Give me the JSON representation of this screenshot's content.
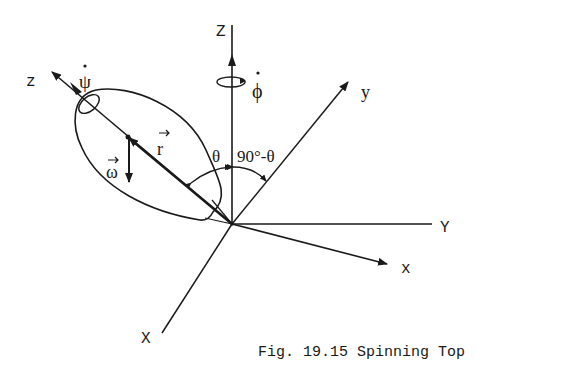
{
  "figure": {
    "caption": "Fig. 19.15 Spinning Top",
    "ink_color": "#1a1a1a",
    "background": "#ffffff"
  },
  "axes": {
    "Z": {
      "label": "Z"
    },
    "Y": {
      "label": "Y"
    },
    "X": {
      "label": "X"
    },
    "z": {
      "label": "z"
    },
    "y": {
      "label": "y"
    },
    "x": {
      "label": "x"
    }
  },
  "vectors": {
    "r": {
      "label": "r"
    },
    "omega": {
      "label": "ω"
    }
  },
  "rates": {
    "psi_dot": {
      "label": "ψ"
    },
    "phi_dot": {
      "label": "ϕ"
    }
  },
  "angles": {
    "theta": {
      "label": "θ"
    },
    "complement": {
      "label": "90°-θ"
    }
  }
}
